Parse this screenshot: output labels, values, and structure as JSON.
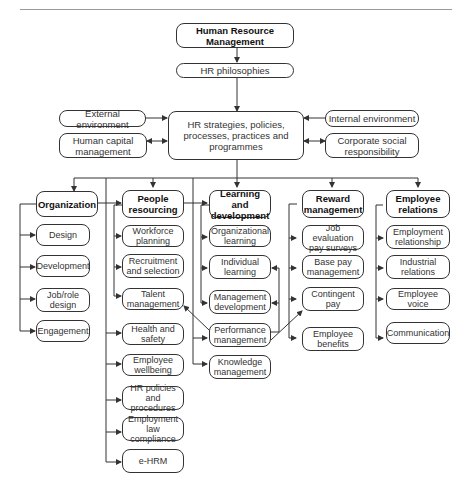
{
  "diagram": {
    "root": "Human Resource Management",
    "philosophy": "HR philosophies",
    "central": "HR strategies, policies, processes, practices and programmes",
    "influences": {
      "external": "External environment",
      "internal": "Internal environment",
      "human_capital": "Human capital management",
      "csr": "Corporate social responsibility"
    },
    "areas": [
      {
        "title": "Organization",
        "items": [
          "Design",
          "Development",
          "Job/role design",
          "Engagement"
        ]
      },
      {
        "title": "People resourcing",
        "items": [
          "Workforce planning",
          "Recruitment and selection",
          "Talent management",
          "Health and safety",
          "Employee wellbeing",
          "HR policies and procedures",
          "Employment law compliance",
          "e-HRM"
        ]
      },
      {
        "title": "Learning and development",
        "items": [
          "Organizational learning",
          "Individual learning",
          "Management development",
          "Performance management",
          "Knowledge management"
        ]
      },
      {
        "title": "Reward management",
        "items": [
          "Job evaluation pay surveys",
          "Base pay management",
          "Contingent pay",
          "Employee benefits"
        ]
      },
      {
        "title": "Employee relations",
        "items": [
          "Employment relationship",
          "Industrial relations",
          "Employee voice",
          "Communication"
        ]
      }
    ],
    "colors": {
      "line": "#333333",
      "border": "#333333",
      "background": "#ffffff"
    }
  }
}
